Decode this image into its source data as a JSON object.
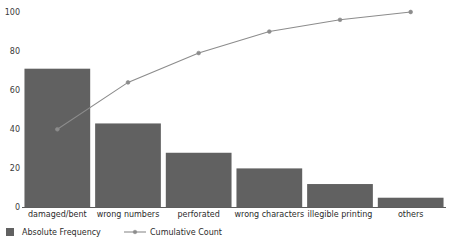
{
  "chart_data": {
    "type": "bar",
    "title": "",
    "subtitle": "",
    "xlabel": "",
    "ylabel": "",
    "ylim": [
      0,
      100
    ],
    "yticks": [
      0,
      20,
      40,
      60,
      80,
      100
    ],
    "grid": false,
    "legend_position": "bottom-left",
    "categories": [
      "damaged/bent",
      "wrong numbers",
      "perforated",
      "wrong characters",
      "illegible printing",
      "others"
    ],
    "series": [
      {
        "name": "Absolute Frequency",
        "type": "bar",
        "color": "#616161",
        "values": [
          71,
          43,
          28,
          20,
          12,
          5
        ]
      },
      {
        "name": "Cumulative Count",
        "type": "line",
        "color": "#8c8c8c",
        "values": [
          40,
          64,
          79,
          90,
          96,
          100
        ]
      }
    ]
  },
  "legend": {
    "items": [
      {
        "label": "Absolute Frequency",
        "marker": "square-swatch",
        "color": "#616161"
      },
      {
        "label": "Cumulative Count",
        "marker": "line-with-point",
        "color": "#8c8c8c"
      }
    ]
  },
  "axis": {
    "y_tick_labels": [
      "100",
      "80",
      "60",
      "40",
      "20",
      "0"
    ],
    "x_tick_labels": [
      "damaged/bent",
      "wrong numbers",
      "perforated",
      "wrong characters",
      "illegible printing",
      "others"
    ]
  }
}
